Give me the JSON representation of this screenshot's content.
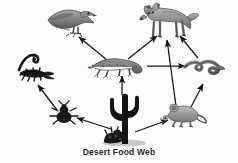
{
  "diagram": {
    "title": "Desert Food Web",
    "type": "food-web",
    "background_color": "#fdfdfd",
    "arrow_color": "#1a1a1a",
    "caption_color": "#2b2b2b",
    "nodes": [
      {
        "id": "hawk",
        "label": "hawk",
        "icon": "hawk-icon",
        "x": 72,
        "y": 24,
        "trophic": "tertiary consumer"
      },
      {
        "id": "coyote",
        "label": "coyote",
        "icon": "coyote-icon",
        "x": 166,
        "y": 22,
        "trophic": "tertiary consumer"
      },
      {
        "id": "lizard",
        "label": "lizard",
        "icon": "lizard-icon",
        "x": 118,
        "y": 66,
        "trophic": "secondary consumer"
      },
      {
        "id": "snake",
        "label": "snake",
        "icon": "snake-icon",
        "x": 203,
        "y": 68,
        "trophic": "secondary consumer"
      },
      {
        "id": "scorpion",
        "label": "scorpion",
        "icon": "scorpion-icon",
        "x": 33,
        "y": 70,
        "trophic": "secondary consumer"
      },
      {
        "id": "beetle",
        "label": "beetle",
        "icon": "beetle-icon",
        "x": 64,
        "y": 115,
        "trophic": "primary consumer"
      },
      {
        "id": "mouse",
        "label": "mouse",
        "icon": "mouse-icon",
        "x": 181,
        "y": 114,
        "trophic": "primary consumer"
      },
      {
        "id": "cactus",
        "label": "cactus",
        "icon": "cactus-icon",
        "x": 126,
        "y": 118,
        "trophic": "producer"
      }
    ],
    "arrows": [
      {
        "from": "lizard",
        "to": "hawk"
      },
      {
        "from": "lizard",
        "to": "coyote"
      },
      {
        "from": "lizard",
        "to": "snake"
      },
      {
        "from": "cactus",
        "to": "lizard"
      },
      {
        "from": "cactus",
        "to": "beetle"
      },
      {
        "from": "cactus",
        "to": "mouse"
      },
      {
        "from": "beetle",
        "to": "scorpion"
      },
      {
        "from": "mouse",
        "to": "coyote"
      },
      {
        "from": "mouse",
        "to": "snake"
      },
      {
        "from": "snake",
        "to": "coyote"
      }
    ]
  }
}
